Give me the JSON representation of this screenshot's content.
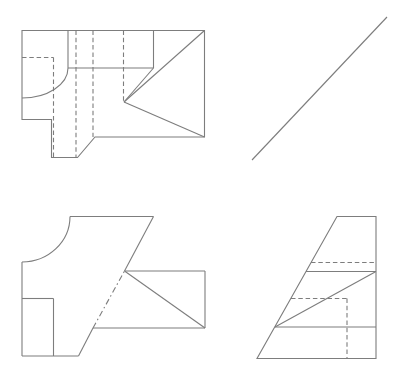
{
  "canvas": {
    "width": 405,
    "height": 385,
    "background_color": "#ffffff"
  },
  "stroke": {
    "color": "#7d7d7d",
    "width": 1.1,
    "dash_pattern": "4.5 2.8",
    "dashdot_pattern": "6 3 1.5 3"
  },
  "figures": [
    {
      "name": "view-top-left",
      "description": "orthographic view with hidden lines, corner fillet arc and triangular face",
      "elements": [
        {
          "kind": "polyline",
          "style": "solid",
          "closed": true,
          "points": [
            [
              22,
              30.5
            ],
            [
              204.5,
              30.5
            ],
            [
              204.5,
              137
            ],
            [
              95,
              137
            ],
            [
              77.5,
              157.5
            ],
            [
              51.5,
              157.5
            ],
            [
              51.5,
              119.5
            ],
            [
              22,
              119.5
            ]
          ]
        },
        {
          "kind": "line",
          "style": "solid",
          "from": [
            68,
            30.5
          ],
          "to": [
            68,
            68
          ]
        },
        {
          "kind": "line",
          "style": "solid",
          "from": [
            68,
            68
          ],
          "to": [
            153.5,
            68
          ]
        },
        {
          "kind": "line",
          "style": "solid",
          "from": [
            153.5,
            30.5
          ],
          "to": [
            153.5,
            68
          ]
        },
        {
          "kind": "arc",
          "style": "solid",
          "start": [
            68,
            68
          ],
          "rx": 46,
          "ry": 30,
          "end": [
            22,
            98
          ]
        },
        {
          "kind": "line",
          "style": "solid",
          "from": [
            124,
            102
          ],
          "to": [
            204.5,
            30.5
          ]
        },
        {
          "kind": "line",
          "style": "solid",
          "from": [
            124,
            102
          ],
          "to": [
            153.5,
            68
          ]
        },
        {
          "kind": "line",
          "style": "solid",
          "from": [
            124,
            102
          ],
          "to": [
            204.5,
            137
          ]
        },
        {
          "kind": "line",
          "style": "dashed",
          "from": [
            22,
            57.5
          ],
          "to": [
            53.5,
            57.5
          ]
        },
        {
          "kind": "line",
          "style": "dashed",
          "from": [
            53.5,
            57.5
          ],
          "to": [
            53.5,
            157.5
          ]
        },
        {
          "kind": "line",
          "style": "dashed",
          "from": [
            76,
            30.5
          ],
          "to": [
            76,
            157.5
          ]
        },
        {
          "kind": "line",
          "style": "dashed",
          "from": [
            93,
            30.5
          ],
          "to": [
            93,
            137
          ]
        },
        {
          "kind": "line",
          "style": "dashed",
          "from": [
            123.5,
            30.5
          ],
          "to": [
            123.5,
            102
          ]
        }
      ]
    },
    {
      "name": "line-top-right",
      "description": "single inclined edge line",
      "elements": [
        {
          "kind": "line",
          "style": "solid",
          "from": [
            252,
            160
          ],
          "to": [
            387,
            17
          ]
        }
      ]
    },
    {
      "name": "view-bottom-left",
      "description": "view with concave quarter-circle notch, hidden dash-dot segment and attached rectangle with diagonal",
      "elements": [
        {
          "kind": "line",
          "style": "solid",
          "from": [
            70,
            216.5
          ],
          "to": [
            153.5,
            216.5
          ]
        },
        {
          "kind": "arc",
          "style": "solid",
          "start": [
            70,
            216.5
          ],
          "rx": 48,
          "ry": 45.5,
          "end": [
            22,
            262
          ]
        },
        {
          "kind": "line",
          "style": "solid",
          "from": [
            22,
            262
          ],
          "to": [
            22,
            356
          ]
        },
        {
          "kind": "line",
          "style": "solid",
          "from": [
            22,
            356
          ],
          "to": [
            78.5,
            356
          ]
        },
        {
          "kind": "line",
          "style": "solid",
          "from": [
            78.5,
            356
          ],
          "to": [
            93,
            328
          ]
        },
        {
          "kind": "line",
          "style": "dashdot",
          "from": [
            93,
            328
          ],
          "to": [
            124.5,
            271
          ]
        },
        {
          "kind": "line",
          "style": "solid",
          "from": [
            124.5,
            271
          ],
          "to": [
            153.5,
            216.5
          ]
        },
        {
          "kind": "line",
          "style": "solid",
          "from": [
            22,
            298.5
          ],
          "to": [
            53.5,
            298.5
          ]
        },
        {
          "kind": "line",
          "style": "solid",
          "from": [
            53.5,
            298.5
          ],
          "to": [
            53.5,
            356
          ]
        },
        {
          "kind": "line",
          "style": "solid",
          "from": [
            124.5,
            271
          ],
          "to": [
            205,
            271
          ]
        },
        {
          "kind": "line",
          "style": "solid",
          "from": [
            205,
            271
          ],
          "to": [
            205,
            328
          ]
        },
        {
          "kind": "line",
          "style": "solid",
          "from": [
            205,
            328
          ],
          "to": [
            93,
            328
          ]
        },
        {
          "kind": "line",
          "style": "solid",
          "from": [
            124.5,
            271
          ],
          "to": [
            205,
            328
          ]
        }
      ]
    },
    {
      "name": "view-bottom-right",
      "description": "trapezoidal side view with hidden dashed lines and inner diagonal",
      "elements": [
        {
          "kind": "polyline",
          "style": "solid",
          "closed": true,
          "points": [
            [
              337,
              216.5
            ],
            [
              376,
              216.5
            ],
            [
              376,
              358.5
            ],
            [
              257,
              358.5
            ]
          ]
        },
        {
          "kind": "line",
          "style": "solid",
          "from": [
            306,
            271.5
          ],
          "to": [
            376,
            271.5
          ]
        },
        {
          "kind": "line",
          "style": "solid",
          "from": [
            275,
            327
          ],
          "to": [
            376,
            327
          ]
        },
        {
          "kind": "line",
          "style": "solid",
          "from": [
            275,
            327
          ],
          "to": [
            376,
            271.5
          ]
        },
        {
          "kind": "line",
          "style": "dashed",
          "from": [
            311,
            262.5
          ],
          "to": [
            376,
            262.5
          ]
        },
        {
          "kind": "line",
          "style": "dashed",
          "from": [
            291,
            298.5
          ],
          "to": [
            347,
            298.5
          ]
        },
        {
          "kind": "line",
          "style": "dashed",
          "from": [
            347,
            298.5
          ],
          "to": [
            347,
            358.5
          ]
        }
      ]
    }
  ]
}
